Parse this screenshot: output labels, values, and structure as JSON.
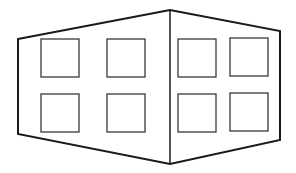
{
  "figure": {
    "colors": {
      "background": "#ffffff",
      "outline": "#1a1a1a",
      "window_stroke": "#3a3a3a"
    },
    "building": {
      "outline_points": [
        [
          18,
          39
        ],
        [
          170,
          10
        ],
        [
          280,
          31
        ],
        [
          280,
          140
        ],
        [
          170,
          164
        ],
        [
          18,
          134
        ]
      ],
      "center_edge": {
        "x": 170,
        "y1": 10,
        "y2": 164
      }
    },
    "windows": [
      {
        "id": "left-top-1",
        "x": 41,
        "y": 39,
        "w": 38,
        "h": 38
      },
      {
        "id": "left-top-2",
        "x": 107,
        "y": 39,
        "w": 38,
        "h": 38
      },
      {
        "id": "left-bottom-1",
        "x": 41,
        "y": 94,
        "w": 38,
        "h": 38
      },
      {
        "id": "left-bottom-2",
        "x": 107,
        "y": 94,
        "w": 38,
        "h": 38
      },
      {
        "id": "right-top-1",
        "x": 178,
        "y": 39,
        "w": 38,
        "h": 38
      },
      {
        "id": "right-top-2",
        "x": 230,
        "y": 38,
        "w": 38,
        "h": 38
      },
      {
        "id": "right-bottom-1",
        "x": 178,
        "y": 94,
        "w": 38,
        "h": 38
      },
      {
        "id": "right-bottom-2",
        "x": 230,
        "y": 93,
        "w": 38,
        "h": 38
      }
    ]
  }
}
